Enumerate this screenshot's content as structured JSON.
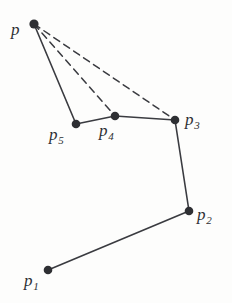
{
  "figure": {
    "kind": "geometry-diagram",
    "width": 232,
    "height": 303,
    "background_color": "#fdfdfc",
    "ink_color": "#3a3b40",
    "vertex_color": "#2e2f33"
  },
  "labels": {
    "p": {
      "base": "p",
      "sub": ""
    },
    "p1": {
      "base": "p",
      "sub": "1"
    },
    "p2": {
      "base": "p",
      "sub": "2"
    },
    "p3": {
      "base": "p",
      "sub": "3"
    },
    "p4": {
      "base": "p",
      "sub": "4"
    },
    "p5": {
      "base": "p",
      "sub": "5"
    }
  },
  "chart_data": {
    "type": "scatter",
    "title": "",
    "xlabel": "",
    "ylabel": "",
    "grid": false,
    "legend": "none",
    "xlim": [
      0,
      232
    ],
    "ylim": [
      303,
      0
    ],
    "points": [
      {
        "id": "p",
        "label": "p",
        "x": 34,
        "y": 24,
        "radius": 4.6
      },
      {
        "id": "p5",
        "label": "p5",
        "x": 76,
        "y": 124,
        "radius": 4.3
      },
      {
        "id": "p4",
        "label": "p4",
        "x": 115,
        "y": 116,
        "radius": 4.3
      },
      {
        "id": "p3",
        "label": "p3",
        "x": 175,
        "y": 120,
        "radius": 4.3
      },
      {
        "id": "p2",
        "label": "p2",
        "x": 189,
        "y": 211,
        "radius": 4.3
      },
      {
        "id": "p1",
        "label": "p1",
        "x": 48,
        "y": 270,
        "radius": 4.3
      }
    ],
    "edges": [
      {
        "from": "p1",
        "to": "p2",
        "style": "solid"
      },
      {
        "from": "p2",
        "to": "p3",
        "style": "solid"
      },
      {
        "from": "p3",
        "to": "p4",
        "style": "solid"
      },
      {
        "from": "p4",
        "to": "p5",
        "style": "solid"
      },
      {
        "from": "p5",
        "to": "p",
        "style": "solid"
      },
      {
        "from": "p",
        "to": "p4",
        "style": "dashed"
      },
      {
        "from": "p",
        "to": "p3",
        "style": "dashed"
      }
    ]
  }
}
